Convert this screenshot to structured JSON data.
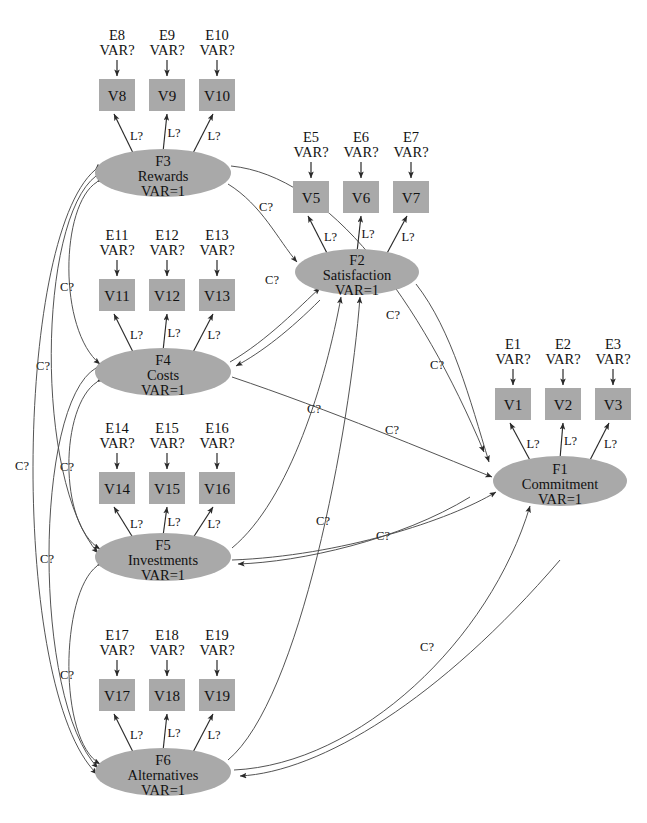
{
  "caption": "",
  "labels": {
    "variance_unknown": "VAR?",
    "variance_fixed": "VAR=1",
    "loading": "L?",
    "covariance": "C?"
  },
  "colors": {
    "node_fill": "#a9a9a9",
    "stroke": "#2a2a2a",
    "text": "#111111",
    "background": "#ffffff"
  },
  "factors": [
    {
      "id": "F3",
      "code": "F3",
      "name": "Rewards",
      "variance": "VAR=1",
      "cx": 163,
      "cy": 173,
      "rx": 68,
      "ry": 24
    },
    {
      "id": "F2",
      "code": "F2",
      "name": "Satisfaction",
      "variance": "VAR=1",
      "cx": 357,
      "cy": 272,
      "rx": 62,
      "ry": 23
    },
    {
      "id": "F1",
      "code": "F1",
      "name": "Commitment",
      "variance": "VAR=1",
      "cx": 560,
      "cy": 481,
      "rx": 67,
      "ry": 25
    },
    {
      "id": "F4",
      "code": "F4",
      "name": "Costs",
      "variance": "VAR=1",
      "cx": 163,
      "cy": 372,
      "rx": 68,
      "ry": 24
    },
    {
      "id": "F5",
      "code": "F5",
      "name": "Investments",
      "variance": "VAR=1",
      "cx": 163,
      "cy": 557,
      "rx": 68,
      "ry": 24
    },
    {
      "id": "F6",
      "code": "F6",
      "name": "Alternatives",
      "variance": "VAR=1",
      "cx": 163,
      "cy": 772,
      "rx": 68,
      "ry": 24
    }
  ],
  "indicators": [
    {
      "id": "V8",
      "box": "V8",
      "error": "E8",
      "err_var": "VAR?",
      "factor": "F3",
      "x": 99,
      "y": 79,
      "w": 36,
      "h": 32
    },
    {
      "id": "V9",
      "box": "V9",
      "error": "E9",
      "err_var": "VAR?",
      "factor": "F3",
      "x": 149,
      "y": 79,
      "w": 36,
      "h": 32
    },
    {
      "id": "V10",
      "box": "V10",
      "error": "E10",
      "err_var": "VAR?",
      "factor": "F3",
      "x": 199,
      "y": 79,
      "w": 36,
      "h": 32
    },
    {
      "id": "V5",
      "box": "V5",
      "error": "E5",
      "err_var": "VAR?",
      "factor": "F2",
      "x": 293,
      "y": 181,
      "w": 36,
      "h": 32
    },
    {
      "id": "V6",
      "box": "V6",
      "error": "E6",
      "err_var": "VAR?",
      "factor": "F2",
      "x": 343,
      "y": 181,
      "w": 36,
      "h": 32
    },
    {
      "id": "V7",
      "box": "V7",
      "error": "E7",
      "err_var": "VAR?",
      "factor": "F2",
      "x": 393,
      "y": 181,
      "w": 36,
      "h": 32
    },
    {
      "id": "V1",
      "box": "V1",
      "error": "E1",
      "err_var": "VAR?",
      "factor": "F1",
      "x": 495,
      "y": 388,
      "w": 36,
      "h": 32
    },
    {
      "id": "V2",
      "box": "V2",
      "error": "E2",
      "err_var": "VAR?",
      "factor": "F1",
      "x": 545,
      "y": 388,
      "w": 36,
      "h": 32
    },
    {
      "id": "V3",
      "box": "V3",
      "error": "E3",
      "err_var": "VAR?",
      "factor": "F1",
      "x": 595,
      "y": 388,
      "w": 36,
      "h": 32
    },
    {
      "id": "V11",
      "box": "V11",
      "error": "E11",
      "err_var": "VAR?",
      "factor": "F4",
      "x": 99,
      "y": 279,
      "w": 36,
      "h": 32
    },
    {
      "id": "V12",
      "box": "V12",
      "error": "E12",
      "err_var": "VAR?",
      "factor": "F4",
      "x": 149,
      "y": 279,
      "w": 36,
      "h": 32
    },
    {
      "id": "V13",
      "box": "V13",
      "error": "E13",
      "err_var": "VAR?",
      "factor": "F4",
      "x": 199,
      "y": 279,
      "w": 36,
      "h": 32
    },
    {
      "id": "V14",
      "box": "V14",
      "error": "E14",
      "err_var": "VAR?",
      "factor": "F5",
      "x": 99,
      "y": 472,
      "w": 36,
      "h": 32
    },
    {
      "id": "V15",
      "box": "V15",
      "error": "E15",
      "err_var": "VAR?",
      "factor": "F5",
      "x": 149,
      "y": 472,
      "w": 36,
      "h": 32
    },
    {
      "id": "V16",
      "box": "V16",
      "error": "E16",
      "err_var": "VAR?",
      "factor": "F5",
      "x": 199,
      "y": 472,
      "w": 36,
      "h": 32
    },
    {
      "id": "V17",
      "box": "V17",
      "error": "E17",
      "err_var": "VAR?",
      "factor": "F6",
      "x": 99,
      "y": 679,
      "w": 36,
      "h": 32
    },
    {
      "id": "V18",
      "box": "V18",
      "error": "E18",
      "err_var": "VAR?",
      "factor": "F6",
      "x": 149,
      "y": 679,
      "w": 36,
      "h": 32
    },
    {
      "id": "V19",
      "box": "V19",
      "error": "E19",
      "err_var": "VAR?",
      "factor": "F6",
      "x": 199,
      "y": 679,
      "w": 36,
      "h": 32
    }
  ],
  "structural_paths": [
    {
      "from": "F3",
      "to": "F2",
      "label": "C?"
    },
    {
      "from": "F4",
      "to": "F2",
      "label": "C?"
    },
    {
      "from": "F5",
      "to": "F2",
      "label": "C?"
    },
    {
      "from": "F6",
      "to": "F2",
      "label": "C?"
    },
    {
      "from": "F2",
      "to": "F1",
      "label": "C?"
    },
    {
      "from": "F3",
      "to": "F1",
      "label": "C?"
    },
    {
      "from": "F4",
      "to": "F1",
      "label": "C?"
    },
    {
      "from": "F5",
      "to": "F1",
      "label": "C?"
    },
    {
      "from": "F6",
      "to": "F1",
      "label": "C?"
    }
  ],
  "covariances": [
    {
      "between": [
        "F3",
        "F4"
      ],
      "label": "C?"
    },
    {
      "between": [
        "F3",
        "F5"
      ],
      "label": "C?"
    },
    {
      "between": [
        "F3",
        "F6"
      ],
      "label": "C?"
    },
    {
      "between": [
        "F4",
        "F5"
      ],
      "label": "C?"
    },
    {
      "between": [
        "F4",
        "F6"
      ],
      "label": "C?"
    },
    {
      "between": [
        "F5",
        "F6"
      ],
      "label": "C?"
    }
  ]
}
